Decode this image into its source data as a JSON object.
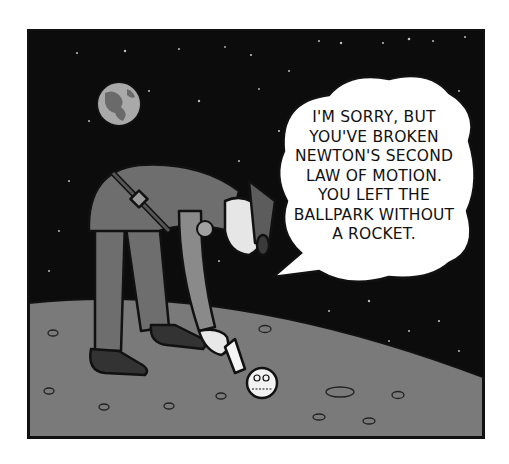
{
  "comic": {
    "speech_bubble": {
      "lines": [
        "I'M SORRY, BUT",
        "YOU'VE BROKEN",
        "NEWTON'S SECOND",
        "LAW OF MOTION.",
        "YOU LEFT THE",
        "BALLPARK WITHOUT",
        "A ROCKET."
      ]
    },
    "scene": {
      "background": "starry-space",
      "ground": "moon-surface",
      "planet": "earth-icon",
      "character": "uniformed-officer",
      "object": "baseball"
    },
    "colors": {
      "sky": "#0c0c0c",
      "ground": "#7a7a7a",
      "uniform": "#6e6e6e",
      "bubble": "#ffffff",
      "outline": "#111111"
    }
  }
}
